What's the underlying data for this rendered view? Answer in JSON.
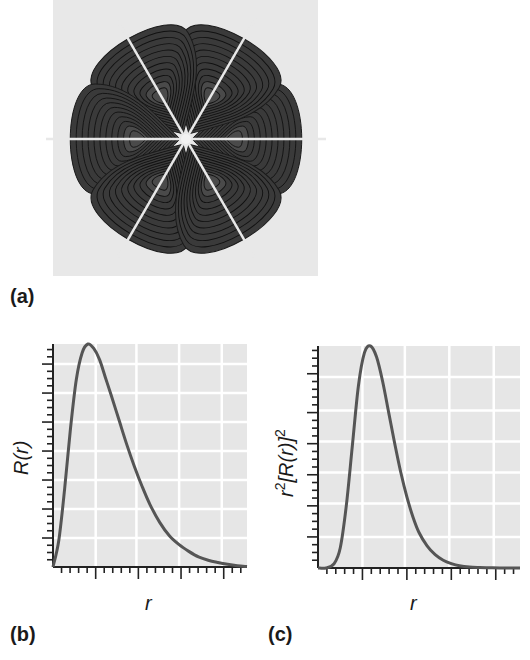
{
  "figure": {
    "panel_a": {
      "label": "(a)",
      "description": "Contour plot of a six-lobed orbital (f-type) cross-section",
      "lobe_angles_deg": [
        0,
        60,
        120,
        180,
        240,
        300
      ],
      "lobe_orientation": "lobes at left/right horizontal and four at ±60° from horizontal",
      "contour_levels": 10,
      "lobe_color": "#3a3a3a",
      "contour_color": "#111111",
      "background_color": "#e8e8e8"
    },
    "panel_b": {
      "label": "(b)",
      "ylabel": "R(r)",
      "xlabel": "r"
    },
    "panel_c": {
      "label": "(c)",
      "ylabel_base": "r",
      "ylabel_sup1": "2",
      "ylabel_mid": "[R(r)]",
      "ylabel_sup2": "2",
      "xlabel": "r"
    }
  },
  "colors": {
    "plot_bg": "#e6e6e6",
    "grid": "#ffffff",
    "curve": "#555555",
    "axis": "#222222"
  },
  "chart_data": [
    {
      "type": "line",
      "title": "",
      "panel": "(b)",
      "xlabel": "r",
      "ylabel": "R(r)",
      "grid": true,
      "legend": null,
      "x_tick_labels": [],
      "y_tick_labels": [],
      "xlim": [
        0,
        1
      ],
      "ylim": [
        0,
        1
      ],
      "x_major_ticks": [
        0.22,
        0.43,
        0.65,
        0.87
      ],
      "y_major_ticks": [
        0.13,
        0.26,
        0.39,
        0.52,
        0.65,
        0.78,
        0.91
      ],
      "series": [
        {
          "name": "R(r)",
          "x": [
            0.0,
            0.03,
            0.06,
            0.09,
            0.12,
            0.15,
            0.18,
            0.21,
            0.24,
            0.27,
            0.3,
            0.34,
            0.38,
            0.42,
            0.46,
            0.5,
            0.55,
            0.6,
            0.65,
            0.7,
            0.75,
            0.8,
            0.85,
            0.9,
            0.95,
            1.0
          ],
          "y": [
            0.0,
            0.12,
            0.35,
            0.62,
            0.84,
            0.96,
            1.0,
            0.98,
            0.93,
            0.85,
            0.77,
            0.66,
            0.55,
            0.45,
            0.36,
            0.28,
            0.2,
            0.14,
            0.1,
            0.07,
            0.045,
            0.03,
            0.02,
            0.012,
            0.006,
            0.002
          ]
        }
      ]
    },
    {
      "type": "line",
      "title": "",
      "panel": "(c)",
      "xlabel": "r",
      "ylabel": "r^2[R(r)]^2",
      "grid": true,
      "legend": null,
      "x_tick_labels": [],
      "y_tick_labels": [],
      "xlim": [
        0,
        1
      ],
      "ylim": [
        0,
        1
      ],
      "x_major_ticks": [
        0.22,
        0.43,
        0.65,
        0.87
      ],
      "y_major_ticks": [
        0.14,
        0.29,
        0.43,
        0.57,
        0.71,
        0.86
      ],
      "series": [
        {
          "name": "r^2[R(r)]^2",
          "x": [
            0.0,
            0.04,
            0.08,
            0.11,
            0.14,
            0.17,
            0.2,
            0.23,
            0.26,
            0.29,
            0.32,
            0.35,
            0.38,
            0.41,
            0.44,
            0.47,
            0.5,
            0.54,
            0.58,
            0.62,
            0.66,
            0.7,
            0.75,
            0.8,
            0.85,
            0.9,
            1.0
          ],
          "y": [
            0.0,
            0.0,
            0.02,
            0.09,
            0.28,
            0.55,
            0.82,
            0.97,
            1.0,
            0.95,
            0.84,
            0.7,
            0.56,
            0.43,
            0.32,
            0.23,
            0.16,
            0.1,
            0.06,
            0.035,
            0.02,
            0.01,
            0.004,
            0.002,
            0.001,
            0.0,
            0.0
          ]
        }
      ]
    }
  ]
}
